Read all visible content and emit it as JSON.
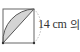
{
  "diagram": {
    "type": "geometry",
    "shape": "square with shaded lens between diagonal and quarter-circle arc",
    "side_label": "14 cm",
    "suffix_text": "의",
    "colors": {
      "stroke": "#555555",
      "fill": "#d4d4d4",
      "dashed_arc": "#aaaaaa"
    }
  }
}
